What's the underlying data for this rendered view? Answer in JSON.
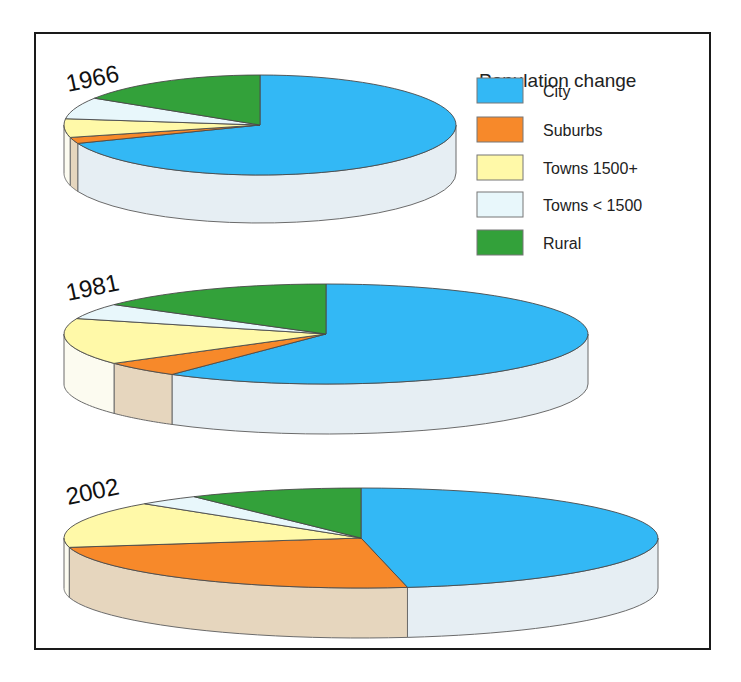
{
  "legend": {
    "title": "Population change",
    "items": [
      {
        "label": "City",
        "color": "#33b8f5",
        "side": "#e6eef3"
      },
      {
        "label": "Suburbs",
        "color": "#f7892a",
        "side": "#e6d6be"
      },
      {
        "label": "Towns 1500+",
        "color": "#fff9a8",
        "side": "#fcfbf0"
      },
      {
        "label": "Towns < 1500",
        "color": "#e8f7fb",
        "side": "#f1f6f8"
      },
      {
        "label": "Rural",
        "color": "#33a13a",
        "side": "#2f8e35"
      }
    ]
  },
  "chart_data": {
    "type": "pie",
    "title": "Population change",
    "style": "3d-pie",
    "categories": [
      "City",
      "Suburbs",
      "Towns 1500+",
      "Towns < 1500",
      "Rural"
    ],
    "legend_position": "top-right",
    "series": [
      {
        "name": "1966",
        "values": [
          69,
          2,
          6,
          7,
          16
        ]
      },
      {
        "name": "1981",
        "values": [
          60,
          5,
          15,
          5,
          15
        ]
      },
      {
        "name": "2002",
        "values": [
          47.5,
          24.5,
          15,
          3.5,
          9.5
        ]
      }
    ],
    "geometry": [
      {
        "year": "1966",
        "cx": 260,
        "cy": 125,
        "rx": 196,
        "ry": 50,
        "depth": 48,
        "label_x": 68,
        "label_y": 92
      },
      {
        "year": "1981",
        "cx": 326,
        "cy": 334,
        "rx": 262,
        "ry": 50,
        "depth": 50,
        "label_x": 68,
        "label_y": 301
      },
      {
        "year": "2002",
        "cx": 361,
        "cy": 538,
        "rx": 297,
        "ry": 50,
        "depth": 50,
        "label_x": 68,
        "label_y": 505
      }
    ]
  }
}
